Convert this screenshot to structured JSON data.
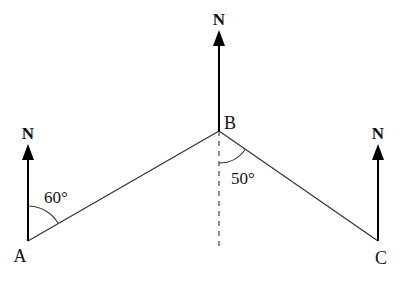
{
  "diagram": {
    "type": "bearing-diagram",
    "points": [
      {
        "label": "A",
        "x": 28,
        "y": 241
      },
      {
        "label": "B",
        "x": 219,
        "y": 131
      },
      {
        "label": "C",
        "x": 378,
        "y": 241
      }
    ],
    "north_label": "N",
    "north_arrows": [
      {
        "at": "A",
        "tip_y": 145,
        "label_y": 139
      },
      {
        "at": "B",
        "tip_y": 31,
        "label_y": 25
      },
      {
        "at": "C",
        "tip_y": 145,
        "label_y": 139
      }
    ],
    "segments": [
      {
        "from": "A",
        "to": "B"
      },
      {
        "from": "B",
        "to": "C"
      }
    ],
    "dashed_line": {
      "from": "B",
      "direction": "south",
      "end_y": 248
    },
    "angles": [
      {
        "at": "A",
        "value": "60°",
        "between": "north and AB"
      },
      {
        "at": "B",
        "value": "50°",
        "between": "south and BC"
      }
    ],
    "labels": {
      "A": "A",
      "B": "B",
      "C": "C",
      "angle_A": "60°",
      "angle_B": "50°",
      "north": "N"
    }
  }
}
